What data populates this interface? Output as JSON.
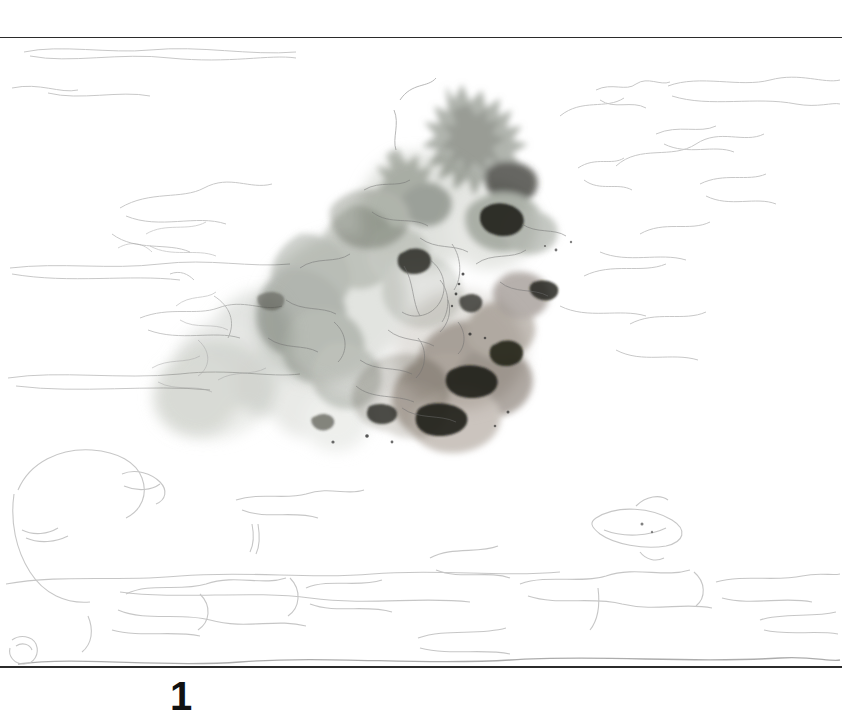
{
  "page": {
    "number": "1",
    "background_color": "#ffffff",
    "width": 842,
    "height": 718
  },
  "rules": {
    "top_rule_color": "#2b2b2b",
    "bottom_rule_color": "#2b2b2b"
  },
  "artwork": {
    "title": "",
    "medium_description": "faint pencil underdrawing with grey-green and warm taupe watercolor wash",
    "palette": {
      "wash_cool_grey": "#a8aca4",
      "wash_warm_taupe": "#a79a90",
      "wash_pale": "#d5d7d1",
      "wash_deep": "#6f7269",
      "accent_dark": "#2e2f2b",
      "pencil_line": "#8a8a8a",
      "pencil_dark": "#4a4a4a",
      "paper": "#ffffff"
    },
    "regions": [
      {
        "name": "flower-mass-upper",
        "note": "dense ragged petal shapes, grey-green, darkest accents"
      },
      {
        "name": "flower-mass-center",
        "note": "pale overlapping blossom forms, light grey"
      },
      {
        "name": "flower-mass-lower-right",
        "note": "warm taupe wash with dark accents"
      },
      {
        "name": "foliage-left",
        "note": "soft diffuse grey wash spreading left"
      },
      {
        "name": "table-contours",
        "note": "faint horizontal pencil lines across lower half"
      },
      {
        "name": "oval-object-right",
        "note": "faint elliptical pencil outline, lower right"
      },
      {
        "name": "round-object-left",
        "note": "faint large round pencil outline, lower left"
      }
    ]
  }
}
